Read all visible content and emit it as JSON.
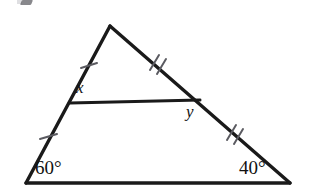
{
  "figure": {
    "type": "geometry-diagram",
    "shape": "triangle-with-midsegment",
    "background_color": "#ffffff",
    "stroke_color": "#1a1a1a",
    "tick_color": "#5b5b61",
    "canvas": {
      "width": 310,
      "height": 191
    },
    "vertices": {
      "apex": {
        "name": "apex",
        "x": 110,
        "y": 26
      },
      "bottom_left": {
        "name": "bottom-left",
        "x": 26,
        "y": 183
      },
      "bottom_right": {
        "name": "bottom-right",
        "x": 290,
        "y": 183
      }
    },
    "midsegment": {
      "name": "midsegment",
      "left": {
        "x": 70,
        "y": 103
      },
      "right": {
        "x": 200,
        "y": 100
      }
    },
    "labels": {
      "x": "x",
      "y": "y",
      "angle_left": "60°",
      "angle_right": "40°"
    },
    "tick_marks": [
      {
        "name": "tick-upper-left",
        "side": "left-upper",
        "count": 1
      },
      {
        "name": "tick-upper-right",
        "side": "right-upper",
        "count": 2
      },
      {
        "name": "tick-lower-left",
        "side": "left-lower",
        "count": 1
      },
      {
        "name": "tick-lower-right",
        "side": "right-lower",
        "count": 2
      }
    ]
  }
}
